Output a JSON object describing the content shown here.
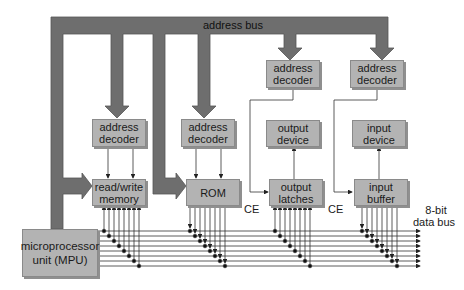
{
  "diagram": {
    "address_bus_label": "address bus",
    "data_bus_label_line1": "8-bit",
    "data_bus_label_line2": "data bus",
    "ce_label": "CE",
    "blocks": {
      "decoder_ram": "address decoder",
      "decoder_rom": "address decoder",
      "decoder_out": "address decoder",
      "decoder_in": "address decoder",
      "ram": "read/write memory",
      "rom": "ROM",
      "output_latches": "output latches",
      "input_buffer": "input buffer",
      "output_device": "output device",
      "input_device": "input device",
      "mpu": "microprocessor unit (MPU)"
    },
    "colors": {
      "bus": "#6e6e6e",
      "box": "#b3b3b3",
      "line": "#333333"
    }
  }
}
